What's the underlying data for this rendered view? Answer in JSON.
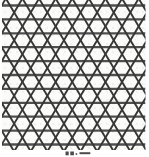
{
  "figure": {
    "name": "trihexagonal-kagome-lattice",
    "background": "#fbfbf9",
    "area": {
      "x": 2,
      "y": 0,
      "w": 143.5,
      "h": 150
    },
    "horizontal_lines": {
      "y_start": 5.5,
      "spacing": 13.9,
      "count": 11,
      "color": "#4f4f4f",
      "width": 2.3
    },
    "diagonal_lines": {
      "slope_dx_per_dy": 0.5971,
      "period": 16.6,
      "family_down_right": {
        "x_at_first_line_start": -73.0,
        "count": 14
      },
      "family_down_left": {
        "x_at_first_line_start": 1.7,
        "count": 14
      },
      "color": "#363636",
      "width": 1.9,
      "y_top": -3,
      "y_bottom": 153
    }
  },
  "caption": {
    "color": "#4c4c4c",
    "marks": [
      {
        "x": 65.5,
        "y": 151.5,
        "w": 3.2,
        "h": 3.8
      },
      {
        "x": 70.3,
        "y": 151.5,
        "w": 3.6,
        "h": 3.8
      },
      {
        "x": 75.6,
        "y": 153.2,
        "w": 1.6,
        "h": 1.6
      },
      {
        "x": 79.5,
        "y": 152.2,
        "w": 10.8,
        "h": 2.0
      }
    ]
  }
}
